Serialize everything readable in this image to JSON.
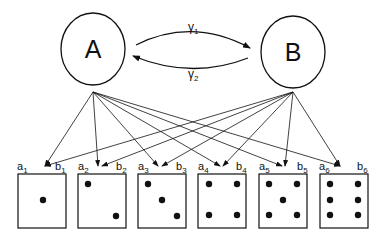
{
  "nodes": {
    "A": {
      "label": "A"
    },
    "B": {
      "label": "B"
    }
  },
  "transitions": {
    "forward": {
      "symbol": "γ",
      "sub": "1"
    },
    "backward": {
      "symbol": "γ",
      "sub": "2"
    }
  },
  "outcomes": [
    {
      "a": "a",
      "a_sub": "1",
      "b": "b",
      "b_sub": "1",
      "pips": 1
    },
    {
      "a": "a",
      "a_sub": "2",
      "b": "b",
      "b_sub": "2",
      "pips": 2
    },
    {
      "a": "a",
      "a_sub": "3",
      "b": "b",
      "b_sub": "3",
      "pips": 3
    },
    {
      "a": "a",
      "a_sub": "4",
      "b": "b",
      "b_sub": "4",
      "pips": 4
    },
    {
      "a": "a",
      "a_sub": "5",
      "b": "b",
      "b_sub": "5",
      "pips": 5
    },
    {
      "a": "a",
      "a_sub": "6",
      "b": "b",
      "b_sub": "6",
      "pips": 6
    }
  ],
  "colors": {
    "stroke": "#111111",
    "background": "#ffffff"
  }
}
